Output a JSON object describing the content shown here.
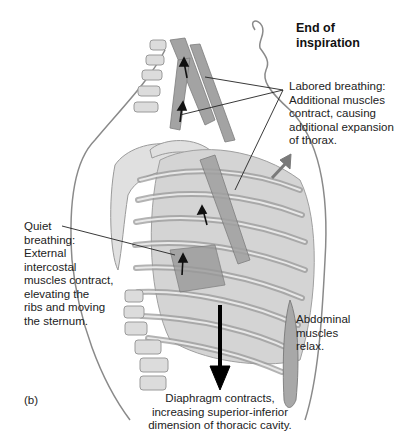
{
  "figure": {
    "panel_label": "(b)",
    "title_line1": "End of",
    "title_line2": "inspiration",
    "palette": {
      "background": "#ffffff",
      "outline": "#8a8a8a",
      "bone_fill": "#d9d9d9",
      "bone_edge": "#9a9a9a",
      "muscle": "#8c8c8c",
      "lung": "#cfcfcf",
      "arrow": "#111111",
      "expansion_arrow": "#7a7a7a",
      "leader_line": "#222222"
    }
  },
  "labels": {
    "labored": {
      "lines": [
        "Labored breathing:",
        "Additional muscles",
        "contract, causing",
        "additional expansion",
        "of thorax."
      ]
    },
    "quiet": {
      "lines": [
        "Quiet",
        "breathing:",
        "External",
        "intercostal",
        "muscles contract,",
        "elevating the",
        "ribs and moving",
        "the sternum."
      ]
    },
    "abdominal": {
      "lines": [
        "Abdominal",
        "muscles",
        "relax."
      ]
    },
    "diaphragm": {
      "lines": [
        "Diaphragm contracts,",
        "increasing superior-inferior",
        "dimension of thoracic cavity."
      ]
    }
  }
}
